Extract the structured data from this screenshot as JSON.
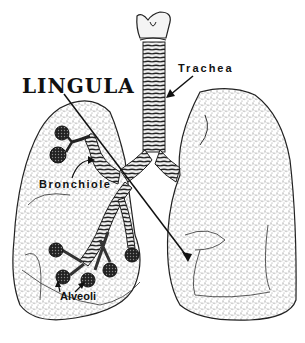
{
  "diagram": {
    "labels": {
      "lingula": "LINGULA",
      "trachea": "Trachea",
      "bronchiole": "Bronchiole",
      "alveoli": "Alveoli"
    },
    "colors": {
      "ink": "#111111",
      "background": "#ffffff",
      "stipple": "#555555"
    }
  }
}
